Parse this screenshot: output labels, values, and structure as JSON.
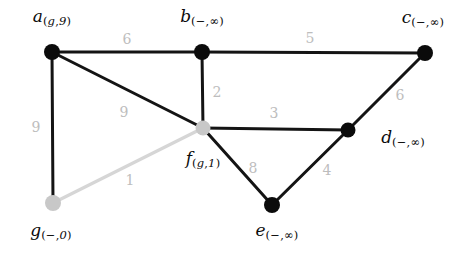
{
  "diagram": {
    "canvas": {
      "width": 475,
      "height": 256,
      "background": "#ffffff"
    },
    "colors": {
      "node_visited": "#0b0b0b",
      "node_frontier": "#c8c8c8",
      "edge_normal": "#141414",
      "edge_highlight": "#d6d6d6",
      "weight_text": "#bdbdbd",
      "label_text": "#0b0b0b"
    },
    "nodes": [
      {
        "id": "a",
        "name": "a",
        "sub_pred": "g",
        "sub_dist": "9",
        "label": "a(g,9)",
        "x": 52,
        "y": 52,
        "r": 8,
        "color": "#0b0b0b",
        "label_x": 52,
        "label_y": 18
      },
      {
        "id": "b",
        "name": "b",
        "sub_pred": "−",
        "sub_dist": "∞",
        "label": "b(−,∞)",
        "x": 202,
        "y": 52,
        "r": 8,
        "color": "#0b0b0b",
        "label_x": 202,
        "label_y": 18
      },
      {
        "id": "c",
        "name": "c",
        "sub_pred": "−",
        "sub_dist": "∞",
        "label": "c(−,∞)",
        "x": 425,
        "y": 53,
        "r": 8,
        "color": "#0b0b0b",
        "label_x": 423,
        "label_y": 19
      },
      {
        "id": "d",
        "name": "d",
        "sub_pred": "−",
        "sub_dist": "∞",
        "label": "d(−,∞)",
        "x": 348,
        "y": 130,
        "r": 7.5,
        "color": "#0b0b0b",
        "label_x": 403,
        "label_y": 139
      },
      {
        "id": "e",
        "name": "e",
        "sub_pred": "−",
        "sub_dist": "∞",
        "label": "e(−,∞)",
        "x": 272,
        "y": 205,
        "r": 8,
        "color": "#0b0b0b",
        "label_x": 277,
        "label_y": 232
      },
      {
        "id": "f",
        "name": "f",
        "sub_pred": "g",
        "sub_dist": "1",
        "label": "f(g,1)",
        "x": 203,
        "y": 128,
        "r": 7.5,
        "color": "#c8c8c8",
        "label_x": 203,
        "label_y": 160
      },
      {
        "id": "g",
        "name": "g",
        "sub_pred": "−",
        "sub_dist": "0",
        "label": "g(−,0)",
        "x": 53,
        "y": 203,
        "r": 8,
        "color": "#c8c8c8",
        "label_x": 51,
        "label_y": 232
      }
    ],
    "edges": [
      {
        "from": "a",
        "to": "b",
        "weight": "6",
        "highlight": false,
        "label_x": 127,
        "label_y": 39
      },
      {
        "from": "b",
        "to": "c",
        "weight": "5",
        "highlight": false,
        "label_x": 310,
        "label_y": 38
      },
      {
        "from": "a",
        "to": "g",
        "weight": "9",
        "highlight": false,
        "label_x": 36,
        "label_y": 127
      },
      {
        "from": "a",
        "to": "f",
        "weight": "9",
        "highlight": false,
        "label_x": 124,
        "label_y": 112
      },
      {
        "from": "b",
        "to": "f",
        "weight": "2",
        "highlight": false,
        "label_x": 217,
        "label_y": 92
      },
      {
        "from": "f",
        "to": "d",
        "weight": "3",
        "highlight": false,
        "label_x": 274,
        "label_y": 113
      },
      {
        "from": "c",
        "to": "d",
        "weight": "6",
        "highlight": false,
        "label_x": 400,
        "label_y": 95
      },
      {
        "from": "f",
        "to": "e",
        "weight": "8",
        "highlight": false,
        "label_x": 253,
        "label_y": 168
      },
      {
        "from": "d",
        "to": "e",
        "weight": "4",
        "highlight": false,
        "label_x": 327,
        "label_y": 170
      },
      {
        "from": "g",
        "to": "f",
        "weight": "1",
        "highlight": true,
        "label_x": 130,
        "label_y": 180
      }
    ]
  }
}
